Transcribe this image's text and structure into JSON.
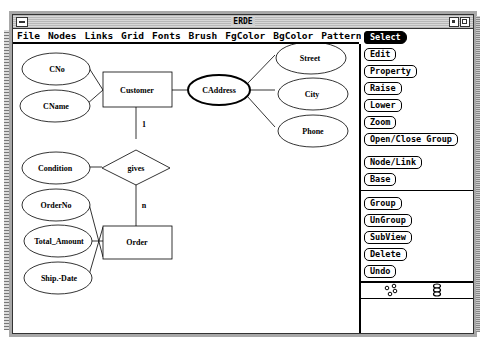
{
  "window": {
    "title": "ERDE"
  },
  "menubar": {
    "items": [
      "File",
      "Nodes",
      "Links",
      "Grid",
      "Fonts",
      "Brush",
      "FgColor",
      "BgColor",
      "Pattern"
    ]
  },
  "palette": {
    "buttons": [
      {
        "label": "Select",
        "active": true
      },
      {
        "label": "Edit"
      },
      {
        "label": "Property"
      },
      {
        "label": "Raise"
      },
      {
        "label": "Lower"
      },
      {
        "label": "Zoom"
      },
      {
        "label": "Open/Close Group"
      },
      {
        "label": "Node/Link"
      },
      {
        "label": "Base"
      },
      {
        "label": "Group"
      },
      {
        "label": "UnGroup"
      },
      {
        "label": "SubView"
      },
      {
        "label": "Delete"
      },
      {
        "label": "Undo"
      }
    ],
    "tool_icons": [
      "scatter-nodes-icon",
      "stack-nodes-icon"
    ]
  },
  "diagram": {
    "entities": [
      {
        "id": "customer",
        "label": "Customer"
      },
      {
        "id": "order",
        "label": "Order"
      }
    ],
    "relationships": [
      {
        "id": "gives",
        "label": "gives"
      }
    ],
    "attributes": [
      {
        "id": "cno",
        "label": "CNo"
      },
      {
        "id": "cname",
        "label": "CName"
      },
      {
        "id": "caddress",
        "label": "CAddress",
        "composite": true
      },
      {
        "id": "street",
        "label": "Street"
      },
      {
        "id": "city",
        "label": "City"
      },
      {
        "id": "phone",
        "label": "Phone"
      },
      {
        "id": "condition",
        "label": "Condition"
      },
      {
        "id": "orderno",
        "label": "OrderNo"
      },
      {
        "id": "total_amount",
        "label": "Total_Amount"
      },
      {
        "id": "ship_date",
        "label": "Ship.-Date"
      }
    ],
    "cardinalities": {
      "customer_gives": "1",
      "gives_order": "n"
    }
  }
}
